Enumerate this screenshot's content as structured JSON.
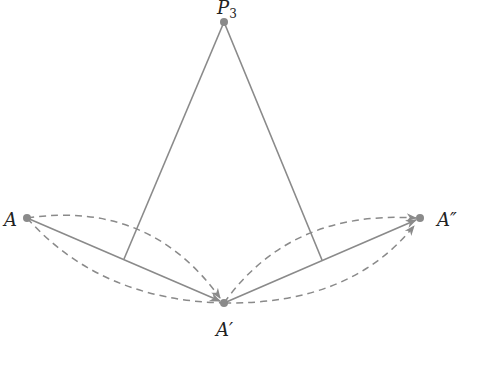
{
  "diagram": {
    "colors": {
      "line": "#8a8a8a",
      "point": "#8a8a8a",
      "text": "#222222"
    },
    "points": {
      "P3": {
        "label": "P",
        "subscript": "3",
        "x": 224,
        "y": 22
      },
      "A": {
        "label": "A",
        "x": 27,
        "y": 218
      },
      "A_prime": {
        "label": "A′",
        "x": 224,
        "y": 303
      },
      "A_double_prime": {
        "label": "A″",
        "x": 420,
        "y": 218
      }
    },
    "feet": {
      "left": {
        "x": 124,
        "y": 259
      },
      "right": {
        "x": 322,
        "y": 260
      }
    }
  }
}
